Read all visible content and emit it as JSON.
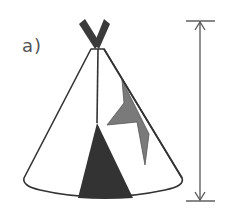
{
  "figure": {
    "label": "a)",
    "measurement": "vertical height arrow to the right of the tipi"
  },
  "colors": {
    "outline": "#333333",
    "poles": "#3a3a3a",
    "door": "#333333",
    "lightning": "#7a7a7a",
    "label": "#555555",
    "background": "#ffffff",
    "arrow": "#555555"
  }
}
